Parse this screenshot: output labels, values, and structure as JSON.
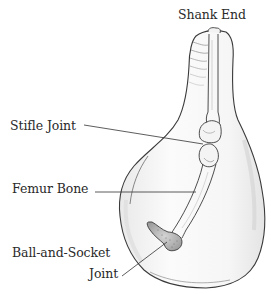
{
  "diagram": {
    "labels": {
      "shank_end": "Shank End",
      "stifle_joint": "Stifle Joint",
      "femur_bone": "Femur Bone",
      "ball_and_socket_line1": "Ball-and-Socket",
      "ball_and_socket_line2": "Joint"
    },
    "colors": {
      "background": "#ffffff",
      "outline": "#3a3a3a",
      "shading": "#c8c8c8",
      "text": "#2a2a2a",
      "leader_line": "#333333"
    }
  }
}
